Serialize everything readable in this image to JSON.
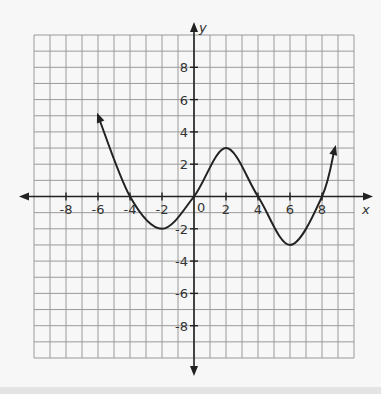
{
  "chart_data": {
    "type": "line",
    "title": "",
    "xlabel": "x",
    "ylabel": "y",
    "xlim": [
      -10,
      10
    ],
    "ylim": [
      -10,
      10
    ],
    "grid": true,
    "grid_step": 1,
    "x_ticks": [
      -8,
      -6,
      -4,
      -2,
      0,
      2,
      4,
      6,
      8
    ],
    "x_tick_labels": [
      "-8",
      "-6",
      "-4",
      "-2",
      "0",
      "2",
      "4",
      "6",
      "8"
    ],
    "y_ticks": [
      8,
      6,
      4,
      2,
      -2,
      -4,
      -6,
      -8
    ],
    "y_tick_labels": [
      "8",
      "6",
      "4",
      "2",
      "-2",
      "-4",
      "-6",
      "-8"
    ],
    "origin_label": "0",
    "series": [
      {
        "name": "f(x)",
        "description": "Smooth curve with arrows at both ends",
        "key_points": [
          {
            "x": -6,
            "y": 5,
            "note": "arrow end"
          },
          {
            "x": -4,
            "y": 0
          },
          {
            "x": -2,
            "y": -2,
            "note": "local minimum"
          },
          {
            "x": 0,
            "y": 0
          },
          {
            "x": 2,
            "y": 3,
            "note": "local maximum"
          },
          {
            "x": 4,
            "y": 0
          },
          {
            "x": 6,
            "y": -3,
            "note": "local minimum"
          },
          {
            "x": 8,
            "y": 0
          },
          {
            "x": 8.8,
            "y": 3,
            "note": "arrow end"
          }
        ]
      }
    ],
    "colors": {
      "grid": "#9a9a9a",
      "axis": "#222222",
      "curve": "#222222"
    }
  }
}
